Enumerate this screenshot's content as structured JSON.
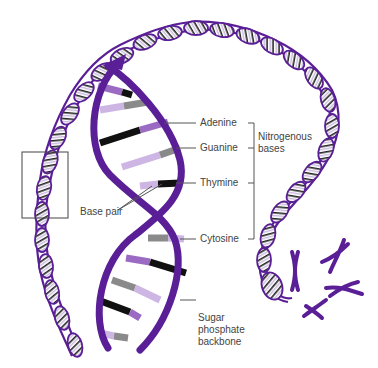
{
  "diagram": {
    "colors": {
      "backbone": "#5a1f96",
      "adenine": "#9b6bc4",
      "guanine": "#8a8a8a",
      "thymine": "#111111",
      "cytosine": "#cdb6e4",
      "label_text": "#444444",
      "leader_line": "#555555"
    },
    "labels": {
      "adenine": "Adenine",
      "guanine": "Guanine",
      "thymine": "Thymine",
      "cytosine": "Cytosine",
      "nitrogenous_bases_line1": "Nitrogenous",
      "nitrogenous_bases_line2": "bases",
      "base_pair": "Base pair",
      "backbone_line1": "Sugar",
      "backbone_line2": "phosphate",
      "backbone_line3": "backbone"
    },
    "elements": [
      "long coiled DNA strand",
      "magnified double helix",
      "zoom box on left strand",
      "chromosomes"
    ]
  }
}
